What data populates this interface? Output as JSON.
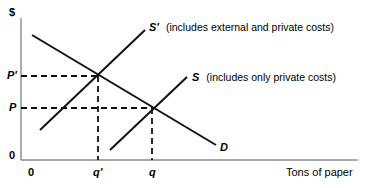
{
  "figure": {
    "type": "economics-supply-demand-diagram",
    "background_color": "#ffffff",
    "line_color": "#000000",
    "axis_color": "#808080"
  },
  "axes": {
    "y_axis_unit_label": "$",
    "y_axis_origin_label": "0",
    "x_axis_origin_label": "0",
    "x_axis_title": "Tons of paper"
  },
  "price_ticks": [
    {
      "label": "P'",
      "name": "price-p-prime"
    },
    {
      "label": "P",
      "name": "price-p"
    }
  ],
  "quantity_ticks": [
    {
      "label": "q'",
      "name": "quantity-q-prime"
    },
    {
      "label": "q",
      "name": "quantity-q"
    }
  ],
  "curves": [
    {
      "id": "s-prime",
      "label": "S'",
      "description": "(includes external and private costs)",
      "role": "social-supply"
    },
    {
      "id": "s",
      "label": "S",
      "description": "(includes only private costs)",
      "role": "private-supply"
    },
    {
      "id": "d",
      "label": "D",
      "description": "",
      "role": "demand"
    }
  ],
  "equilibria": [
    {
      "name": "social-equilibrium",
      "price": "P'",
      "quantity": "q'"
    },
    {
      "name": "market-equilibrium",
      "price": "P",
      "quantity": "q"
    }
  ]
}
